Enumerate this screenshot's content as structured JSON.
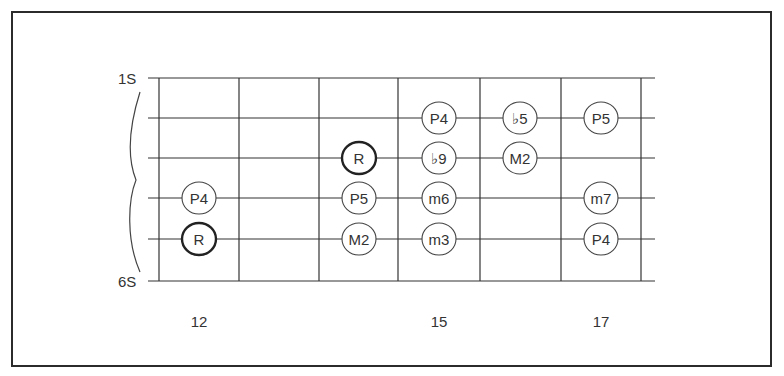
{
  "diagram": {
    "type": "guitar-fretboard",
    "string_labels": {
      "top": "1S",
      "bottom": "6S"
    },
    "fret_numbers": [
      {
        "label": "12",
        "x": 199
      },
      {
        "label": "15",
        "x": 439
      },
      {
        "label": "17",
        "x": 601
      }
    ],
    "fret_lines_x": [
      159,
      239,
      319,
      398,
      480,
      561,
      641
    ],
    "string_lines_y": [
      78,
      118,
      158,
      198,
      239,
      281
    ],
    "notes": [
      {
        "label": "P4",
        "string": 2,
        "x": 439,
        "root": false
      },
      {
        "label": "♭5",
        "string": 2,
        "x": 520,
        "root": false
      },
      {
        "label": "P5",
        "string": 2,
        "x": 601,
        "root": false
      },
      {
        "label": "R",
        "string": 3,
        "x": 359,
        "root": true
      },
      {
        "label": "♭9",
        "string": 3,
        "x": 439,
        "root": false
      },
      {
        "label": "M2",
        "string": 3,
        "x": 520,
        "root": false
      },
      {
        "label": "P4",
        "string": 4,
        "x": 199,
        "root": false
      },
      {
        "label": "P5",
        "string": 4,
        "x": 359,
        "root": false
      },
      {
        "label": "m6",
        "string": 4,
        "x": 439,
        "root": false
      },
      {
        "label": "m7",
        "string": 4,
        "x": 601,
        "root": false
      },
      {
        "label": "R",
        "string": 5,
        "x": 199,
        "root": true
      },
      {
        "label": "M2",
        "string": 5,
        "x": 359,
        "root": false
      },
      {
        "label": "m3",
        "string": 5,
        "x": 439,
        "root": false
      },
      {
        "label": "P4",
        "string": 5,
        "x": 601,
        "root": false
      }
    ]
  }
}
